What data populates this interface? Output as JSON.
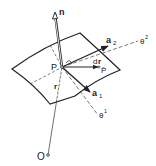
{
  "diagram": {
    "labels": {
      "normal": "n",
      "tangent2": "a",
      "tangent2_sub": "2",
      "tangent1": "a",
      "tangent1_sub": "1",
      "coord2": "θ",
      "coord2_sup": "2",
      "coord1": "θ",
      "coord1_sup": "1",
      "point_P": "P",
      "point_Pbar": "P̄",
      "differential": "d",
      "differential_r": "r",
      "position": "r",
      "origin": "O"
    },
    "stroke_color": "#222222"
  }
}
